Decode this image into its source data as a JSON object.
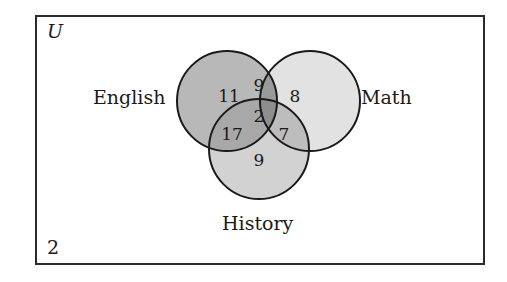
{
  "universe": {
    "symbol": "U",
    "outside_count": "2"
  },
  "sets": [
    {
      "name": "English",
      "fill": "#b8b8b8"
    },
    {
      "name": "Math",
      "fill": "#e2e2e2"
    },
    {
      "name": "History",
      "fill": "#d2d2d2"
    }
  ],
  "regions": {
    "english_only": "11",
    "math_only": "8",
    "history_only": "9",
    "english_math_only": "9",
    "english_history_only": "17",
    "math_history_only": "7",
    "all_three": "2"
  },
  "colors": {
    "stroke": "#1a1a1a",
    "border": "#2b2b2b",
    "english_fill": "#b8b8b8",
    "math_fill": "#e2e2e2",
    "history_fill": "#d2d2d2",
    "overlap_em": "#9a9a9a",
    "overlap_eh": "#a8a8a8",
    "overlap_mh": "#bdbdbd",
    "overlap_all": "#8e8e8e"
  }
}
